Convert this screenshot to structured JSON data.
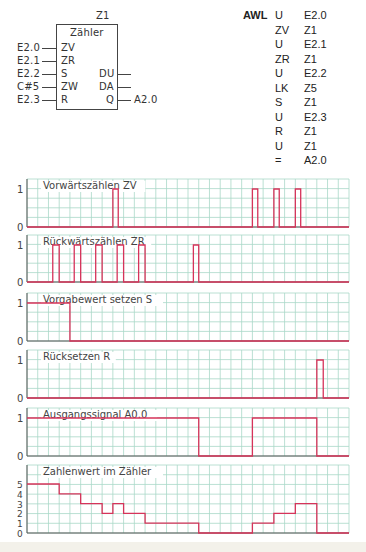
{
  "fbd": {
    "block_name": "Z1",
    "block_title": "Zähler",
    "inputs": [
      {
        "signal": "E2.0",
        "pin": "ZV"
      },
      {
        "signal": "E2.1",
        "pin": "ZR"
      },
      {
        "signal": "E2.2",
        "pin": "S"
      },
      {
        "signal": "C#5",
        "pin": "ZW"
      },
      {
        "signal": "E2.3",
        "pin": "R"
      }
    ],
    "outputs": [
      {
        "pin": "DU",
        "signal": ""
      },
      {
        "pin": "DA",
        "signal": ""
      },
      {
        "pin": "Q",
        "signal": "A2.0"
      }
    ]
  },
  "awl": {
    "title": "AWL",
    "lines": [
      {
        "op": "U",
        "operand": "E2.0"
      },
      {
        "op": "ZV",
        "operand": "Z1"
      },
      {
        "op": "U",
        "operand": "E2.1"
      },
      {
        "op": "ZR",
        "operand": "Z1"
      },
      {
        "op": "U",
        "operand": "E2.2"
      },
      {
        "op": "LK",
        "operand": "Z5"
      },
      {
        "op": "S",
        "operand": "Z1"
      },
      {
        "op": "U",
        "operand": "E2.3"
      },
      {
        "op": "R",
        "operand": "Z1"
      },
      {
        "op": "U",
        "operand": "Z1"
      },
      {
        "op": "=",
        "operand": "A2.0"
      }
    ]
  },
  "colors": {
    "signal": "#d6335a",
    "grid": "#a9d8c8",
    "axis": "#555555",
    "band": "#f3f1ea"
  },
  "chart_data": {
    "type": "line",
    "step": true,
    "x_units": "grid columns (time)",
    "xlim": [
      0,
      30
    ],
    "grid": true,
    "series": [
      {
        "name": "Vorwärtszählen ZV",
        "ylabel_ticks": [
          "0",
          "1"
        ],
        "ymax": 1,
        "pulses": [
          [
            8.0,
            8.5
          ],
          [
            21.0,
            21.5
          ],
          [
            23.0,
            23.5
          ],
          [
            25.0,
            25.5
          ]
        ]
      },
      {
        "name": "Rückwärtszählen ZR",
        "ylabel_ticks": [
          "0",
          "1"
        ],
        "ymax": 1,
        "pulses": [
          [
            2.4,
            3.0
          ],
          [
            4.4,
            5.0
          ],
          [
            6.4,
            7.0
          ],
          [
            8.4,
            9.0
          ],
          [
            10.4,
            11.0
          ],
          [
            15.5,
            16.0
          ]
        ]
      },
      {
        "name": "Vorgabewert setzen S",
        "ylabel_ticks": [
          "0",
          "1"
        ],
        "ymax": 1,
        "steps": [
          [
            0,
            1
          ],
          [
            4.0,
            0
          ],
          [
            30,
            0
          ]
        ]
      },
      {
        "name": "Rücksetzen R",
        "ylabel_ticks": [
          "0",
          "1"
        ],
        "ymax": 1,
        "pulses": [
          [
            27.0,
            27.6
          ]
        ]
      },
      {
        "name": "Ausgangssignal A0.0",
        "ylabel_ticks": [
          "0",
          "1"
        ],
        "ymax": 1,
        "steps": [
          [
            0,
            1
          ],
          [
            16.0,
            0
          ],
          [
            21.0,
            1
          ],
          [
            27.0,
            0
          ],
          [
            30,
            0
          ]
        ]
      },
      {
        "name": "Zahlenwert im Zähler",
        "ylabel_ticks": [
          "0",
          "1",
          "2",
          "3",
          "4",
          "5"
        ],
        "ymax": 5,
        "steps": [
          [
            0,
            5
          ],
          [
            3.0,
            4
          ],
          [
            5.0,
            3
          ],
          [
            7.0,
            2
          ],
          [
            8.0,
            3
          ],
          [
            9.0,
            2
          ],
          [
            11.0,
            1
          ],
          [
            16.0,
            0
          ],
          [
            21.0,
            1
          ],
          [
            23.0,
            2
          ],
          [
            25.0,
            3
          ],
          [
            27.0,
            0
          ],
          [
            30,
            0
          ]
        ]
      }
    ]
  }
}
